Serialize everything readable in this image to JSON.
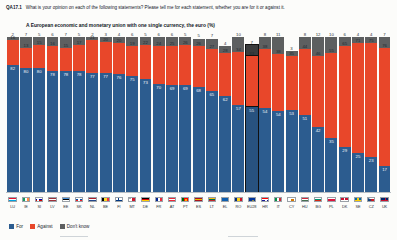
{
  "question": {
    "code": "QA17.1",
    "text": "What is your opinion on each of the following statements? Please tell me for each statement, whether you are for it or against it.",
    "subtitle": "A European economic and monetary union with one single currency, the euro  (%)"
  },
  "legend": {
    "for_label": "For",
    "against_label": "Against",
    "dontknow_label": "Don't know"
  },
  "colors": {
    "for": "#2c5c8f",
    "against": "#e8472a",
    "dontknow": "#5d5f60",
    "highlight_outline": "#111111"
  },
  "chart_data": {
    "type": "bar",
    "title": "A European economic and monetary union with one single currency, the euro  (%)",
    "xlabel": "",
    "ylabel": "",
    "ylim": [
      0,
      100
    ],
    "grid": false,
    "stacked": true,
    "legend_position": "bottom-left",
    "highlight_category": "EU28",
    "categories": [
      "LU",
      "IE",
      "SI",
      "LV",
      "EE",
      "SK",
      "NL",
      "BE",
      "FI",
      "MT",
      "DE",
      "FR",
      "AT",
      "PT",
      "ES",
      "LT",
      "EL",
      "RO",
      "EU28",
      "HR",
      "IT",
      "CY",
      "HU",
      "BG",
      "PL",
      "DK",
      "SE",
      "CZ",
      "UK"
    ],
    "series": [
      {
        "name": "For",
        "values": [
          82,
          80,
          80,
          78,
          78,
          78,
          77,
          77,
          76,
          75,
          73,
          70,
          69,
          69,
          68,
          65,
          62,
          57,
          55,
          54,
          54,
          53,
          51,
          42,
          35,
          29,
          25,
          23,
          17
        ]
      },
      {
        "name": "Against",
        "values": [
          16,
          13,
          15,
          16,
          15,
          17,
          21,
          20,
          20,
          19,
          22,
          24,
          25,
          26,
          26,
          27,
          28,
          34,
          33,
          38,
          38,
          35,
          44,
          46,
          55,
          65,
          71,
          75,
          76
        ]
      },
      {
        "name": "Don't know",
        "values": [
          2,
          7,
          5,
          6,
          7,
          5,
          2,
          3,
          4,
          6,
          5,
          6,
          6,
          5,
          5,
          7,
          4,
          10,
          7,
          8,
          11,
          3,
          8,
          12,
          10,
          6,
          4,
          4,
          7
        ]
      }
    ]
  }
}
